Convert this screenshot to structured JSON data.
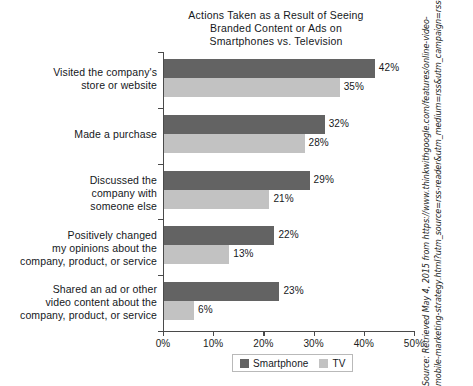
{
  "chart_data": {
    "type": "bar",
    "orientation": "horizontal",
    "title": "Actions Taken as a Result of Seeing Branded Content or Ads on Smartphones vs. Television",
    "title_lines": [
      "Actions Taken as a Result of Seeing",
      "Branded Content or Ads on",
      "Smartphones vs. Television"
    ],
    "categories": [
      "Visited the company's store or website",
      "Made a purchase",
      "Discussed the company with someone else",
      "Positively changed my opinions about the company, product, or service",
      "Shared an ad or other video content about the company, product, or service"
    ],
    "category_lines": [
      [
        "Visited the company's",
        "store or website"
      ],
      [
        "Made a purchase"
      ],
      [
        "Discussed the",
        "company with",
        "someone else"
      ],
      [
        "Positively changed",
        "my opinions about the",
        "company, product, or service"
      ],
      [
        "Shared an ad or other",
        "video content about the",
        "company, product, or service"
      ]
    ],
    "series": [
      {
        "name": "Smartphone",
        "color": "#636363",
        "values": [
          42,
          32,
          29,
          22,
          23
        ],
        "labels": [
          "42%",
          "32%",
          "29%",
          "22%",
          "23%"
        ]
      },
      {
        "name": "TV",
        "color": "#c2c2c2",
        "values": [
          35,
          28,
          21,
          13,
          6
        ],
        "labels": [
          "35%",
          "28%",
          "21%",
          "13%",
          "6%"
        ]
      }
    ],
    "xlabel": "",
    "ylabel": "",
    "xlim": [
      0,
      50
    ],
    "xticks": [
      0,
      10,
      20,
      30,
      40,
      50
    ],
    "xticklabels": [
      "0%",
      "10%",
      "20%",
      "30%",
      "40%",
      "50%"
    ],
    "grid": false,
    "legend_position": "bottom"
  },
  "legend": {
    "items": [
      {
        "label": "Smartphone",
        "color": "#636363"
      },
      {
        "label": "TV",
        "color": "#c2c2c2"
      }
    ]
  },
  "source": {
    "lines": [
      "Source: Retrieved May 4, 2015 from https://www.thinkwithgoogle.com/features/online-video-",
      "mobile-marketing-strategy.html?utm_source=rss-reader&utm_medium=rss&utm_campaign=rss-feed"
    ]
  }
}
